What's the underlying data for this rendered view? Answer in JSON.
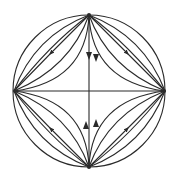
{
  "diagram": {
    "type": "phase-portrait",
    "canvas": {
      "width": 178,
      "height": 181
    },
    "colors": {
      "background": "#ffffff",
      "stroke": "#2a2a2a"
    },
    "circle": {
      "cx": 89,
      "cy": 91,
      "r": 76
    },
    "nodes": [
      {
        "id": "top",
        "x": 89,
        "y": 15,
        "kind": "source"
      },
      {
        "id": "bottom",
        "x": 89,
        "y": 167,
        "kind": "source"
      },
      {
        "id": "left",
        "x": 14,
        "y": 91,
        "kind": "sink"
      },
      {
        "id": "right",
        "x": 165,
        "y": 91,
        "kind": "sink"
      },
      {
        "id": "center",
        "x": 89,
        "y": 91,
        "kind": "saddle"
      }
    ],
    "axes": [
      {
        "id": "vertical",
        "from": "top",
        "to": "bottom",
        "arrows": "toward-center"
      },
      {
        "id": "horizontal",
        "from": "left",
        "to": "right",
        "arrows": "away-from-center"
      }
    ],
    "quadrant_flows": [
      {
        "quadrant": "top-left",
        "from": "top",
        "to": "left",
        "trajectories": 5
      },
      {
        "quadrant": "top-right",
        "from": "top",
        "to": "right",
        "trajectories": 5
      },
      {
        "quadrant": "bottom-left",
        "from": "bottom",
        "to": "left",
        "trajectories": 5
      },
      {
        "quadrant": "bottom-right",
        "from": "bottom",
        "to": "right",
        "trajectories": 5
      }
    ]
  }
}
